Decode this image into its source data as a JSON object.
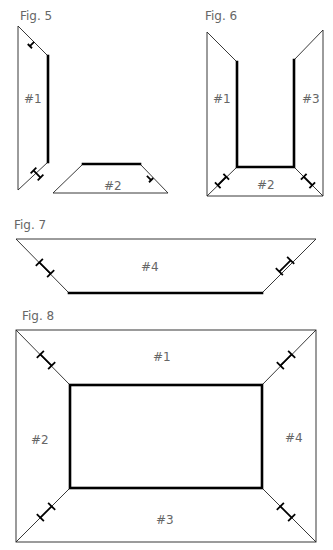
{
  "figures": [
    {
      "label": "Fig. 5",
      "panels": [
        "#1",
        "#2"
      ]
    },
    {
      "label": "Fig. 6",
      "panels": [
        "#1",
        "#2",
        "#3"
      ]
    },
    {
      "label": "Fig. 7",
      "panels": [
        "#4"
      ]
    },
    {
      "label": "Fig. 8",
      "panels": [
        "#1",
        "#2",
        "#3",
        "#4"
      ]
    }
  ],
  "colors": {
    "line": "#222222",
    "thick_edge": "#000000",
    "text": "#666666",
    "background": "#ffffff"
  }
}
